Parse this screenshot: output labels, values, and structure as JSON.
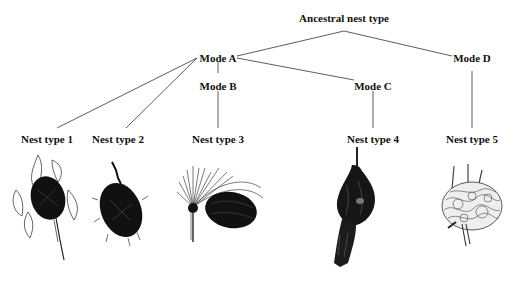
{
  "diagram": {
    "root": {
      "label": "Ancestral nest type",
      "x": 344,
      "y": 12
    },
    "modes": [
      {
        "id": "A",
        "label": "Mode A",
        "x": 218,
        "y": 52
      },
      {
        "id": "B",
        "label": "Mode B",
        "x": 218,
        "y": 80
      },
      {
        "id": "C",
        "label": "Mode C",
        "x": 373,
        "y": 80
      },
      {
        "id": "D",
        "label": "Mode D",
        "x": 472,
        "y": 52
      }
    ],
    "nest_types": [
      {
        "label": "Nest type 1",
        "x": 47,
        "y": 133,
        "parent": "A"
      },
      {
        "label": "Nest type 2",
        "x": 118,
        "y": 133,
        "parent": "A"
      },
      {
        "label": "Nest type 3",
        "x": 218,
        "y": 133,
        "parent": "B"
      },
      {
        "label": "Nest type 4",
        "x": 373,
        "y": 133,
        "parent": "C"
      },
      {
        "label": "Nest type 5",
        "x": 472,
        "y": 133,
        "parent": "D"
      }
    ],
    "edges": [
      [
        "Ancestral nest type",
        "Mode A"
      ],
      [
        "Ancestral nest type",
        "Mode D"
      ],
      [
        "Mode A",
        "Mode B"
      ],
      [
        "Mode A",
        "Mode C"
      ],
      [
        "Mode A",
        "Nest type 1"
      ],
      [
        "Mode A",
        "Nest type 2"
      ],
      [
        "Mode B",
        "Nest type 3"
      ],
      [
        "Mode C",
        "Nest type 4"
      ],
      [
        "Mode D",
        "Nest type 5"
      ]
    ],
    "illustrations": [
      {
        "name": "nest-illustration-1",
        "description": "dark woven nest among leaves on a stem"
      },
      {
        "name": "nest-illustration-2",
        "description": "dark shaggy oval nest on a twig"
      },
      {
        "name": "nest-illustration-3",
        "description": "dark round nest beside a palm-like frond"
      },
      {
        "name": "nest-illustration-4",
        "description": "elongated hanging retort-shaped nest"
      },
      {
        "name": "nest-illustration-5",
        "description": "light tangled ball nest on stems"
      }
    ]
  }
}
